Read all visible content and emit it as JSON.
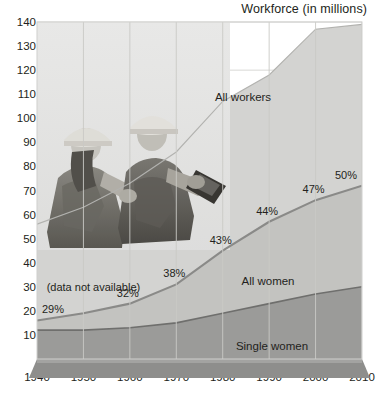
{
  "chart_data": {
    "type": "area",
    "title": "Workforce (in millions)",
    "xlabel": "",
    "ylabel": "Workforce (in millions)",
    "x": [
      1940,
      1950,
      1960,
      1970,
      1980,
      1990,
      2000,
      2010
    ],
    "xlim": [
      1940,
      2010
    ],
    "ylim": [
      0,
      140
    ],
    "yticks": [
      10,
      20,
      30,
      40,
      50,
      60,
      70,
      80,
      90,
      100,
      110,
      120,
      130,
      140
    ],
    "xticks": [
      "1940",
      "1950",
      "1960",
      "1970",
      "1980",
      "1990",
      "2000",
      "2010"
    ],
    "grid": true,
    "stacked": true,
    "legend_position": "inline-labels",
    "series": [
      {
        "name": "All workers",
        "color": "#d3d3d1",
        "values": [
          56,
          63,
          73,
          86,
          107,
          118,
          137,
          139
        ]
      },
      {
        "name": "All women",
        "color": "#c3c3c0",
        "values": [
          16,
          19,
          23,
          31,
          45,
          57,
          66,
          72
        ]
      },
      {
        "name": "Single women",
        "color": "#9b9b99",
        "values": [
          12,
          12,
          13,
          15,
          19,
          23,
          27,
          30
        ]
      }
    ],
    "annotations": [
      {
        "label": "29%",
        "x": 1940,
        "value": 16,
        "kind": "percent"
      },
      {
        "label": "(data not available)",
        "x": 1950,
        "value": 19,
        "kind": "note"
      },
      {
        "label": "32%",
        "x": 1960,
        "value": 23,
        "kind": "percent"
      },
      {
        "label": "38%",
        "x": 1970,
        "value": 31,
        "kind": "percent"
      },
      {
        "label": "43%",
        "x": 1980,
        "value": 45,
        "kind": "percent"
      },
      {
        "label": "44%",
        "x": 1990,
        "value": 57,
        "kind": "percent"
      },
      {
        "label": "47%",
        "x": 2000,
        "value": 66,
        "kind": "percent"
      },
      {
        "label": "50%",
        "x": 2010,
        "value": 72,
        "kind": "percent"
      }
    ],
    "series_labels": [
      {
        "label": "All workers",
        "x": 243,
        "y": 97
      },
      {
        "label": "All women",
        "x": 268,
        "y": 281
      },
      {
        "label": "Single women",
        "x": 272,
        "y": 346
      }
    ],
    "photo_caption": "two construction workers in hard hats"
  },
  "colors": {
    "all_workers": "#d3d3d1",
    "all_women": "#c3c3c0",
    "single_women": "#9b9b99",
    "base_plinth": "#8e8e8c",
    "line": "#8a8a88",
    "text": "#231f20",
    "grid": "#d8d8d6",
    "plot_background": "#ffffff"
  }
}
